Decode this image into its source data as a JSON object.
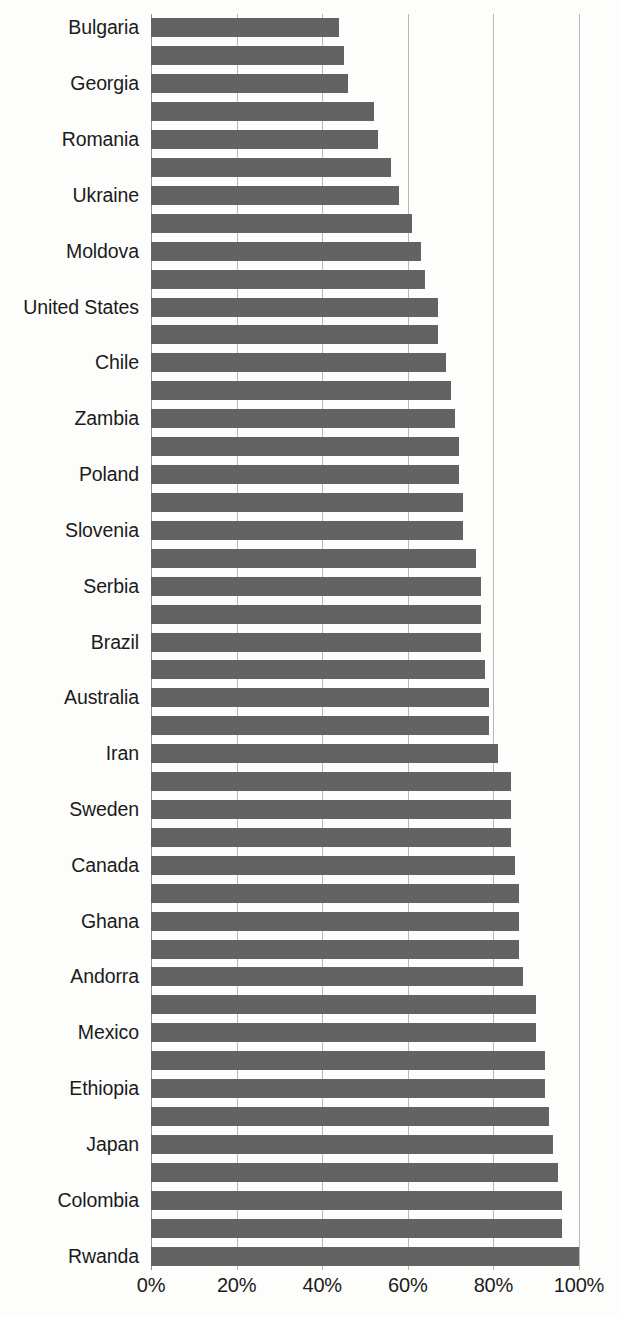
{
  "chart_data": {
    "type": "bar",
    "orientation": "horizontal",
    "title": "",
    "subtitle": "",
    "xlabel": "",
    "ylabel": "",
    "xlim": [
      0,
      100
    ],
    "grid": true,
    "legend": null,
    "legend_position": "none",
    "xticks": [
      0,
      20,
      40,
      60,
      80,
      100
    ],
    "xtick_labels": [
      "0%",
      "20%",
      "40%",
      "60%",
      "80%",
      "100%"
    ],
    "value_unit": "%",
    "bar_color": "#636363",
    "gridline_color": "#b8b8b8",
    "axis_color": "#8e8e8e",
    "note": "Category labels are printed on every other bar (alternating); unlabeled bars are shown between them.",
    "categories": [
      "Bulgaria",
      "",
      "Georgia",
      "",
      "Romania",
      "",
      "Ukraine",
      "",
      "Moldova",
      "",
      "United States",
      "",
      "Chile",
      "",
      "Zambia",
      "",
      "Poland",
      "",
      "Slovenia",
      "",
      "Serbia",
      "",
      "Brazil",
      "",
      "Australia",
      "",
      "Iran",
      "",
      "Sweden",
      "",
      "Canada",
      "",
      "Ghana",
      "",
      "Andorra",
      "",
      "Mexico",
      "",
      "Ethiopia",
      "",
      "Japan",
      "",
      "Colombia",
      "",
      "Rwanda"
    ],
    "values": [
      44,
      45,
      46,
      52,
      53,
      56,
      58,
      61,
      63,
      64,
      67,
      67,
      69,
      70,
      71,
      72,
      72,
      73,
      73,
      76,
      77,
      77,
      77,
      78,
      79,
      79,
      81,
      84,
      84,
      84,
      85,
      86,
      86,
      86,
      87,
      90,
      90,
      92,
      92,
      93,
      94,
      95,
      96,
      96,
      100
    ],
    "labeled_bars": [
      {
        "label": "Bulgaria",
        "value": 44
      },
      {
        "label": "Georgia",
        "value": 46
      },
      {
        "label": "Romania",
        "value": 53
      },
      {
        "label": "Ukraine",
        "value": 58
      },
      {
        "label": "Moldova",
        "value": 63
      },
      {
        "label": "United States",
        "value": 67
      },
      {
        "label": "Chile",
        "value": 69
      },
      {
        "label": "Zambia",
        "value": 71
      },
      {
        "label": "Poland",
        "value": 72
      },
      {
        "label": "Slovenia",
        "value": 73
      },
      {
        "label": "Serbia",
        "value": 77
      },
      {
        "label": "Brazil",
        "value": 77
      },
      {
        "label": "Australia",
        "value": 79
      },
      {
        "label": "Iran",
        "value": 81
      },
      {
        "label": "Sweden",
        "value": 84
      },
      {
        "label": "Canada",
        "value": 85
      },
      {
        "label": "Ghana",
        "value": 86
      },
      {
        "label": "Andorra",
        "value": 87
      },
      {
        "label": "Mexico",
        "value": 90
      },
      {
        "label": "Ethiopia",
        "value": 92
      },
      {
        "label": "Japan",
        "value": 94
      },
      {
        "label": "Colombia",
        "value": 96
      },
      {
        "label": "Rwanda",
        "value": 100
      }
    ]
  }
}
